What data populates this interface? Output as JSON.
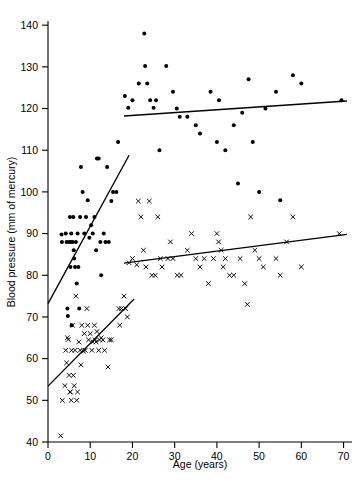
{
  "chart_data": {
    "type": "scatter",
    "title": "",
    "xlabel": "Age (years)",
    "ylabel": "Blood pressure (mm of mercury)",
    "xlim": [
      0,
      72
    ],
    "ylim": [
      40,
      141
    ],
    "xticks": [
      0,
      10,
      20,
      30,
      40,
      50,
      60,
      70
    ],
    "yticks": [
      40,
      50,
      60,
      70,
      80,
      90,
      100,
      110,
      120,
      130,
      140
    ],
    "xtick_labels": [
      "0",
      "10",
      "20",
      "30",
      "40",
      "50",
      "60",
      "70"
    ],
    "ytick_labels": [
      "40",
      "50",
      "60",
      "70",
      "80",
      "90",
      "100",
      "110",
      "120",
      "130",
      "140"
    ],
    "grid": false,
    "legend": "none",
    "series": [
      {
        "name": "Systolic blood pressure",
        "marker": "filled-circle",
        "color": "#000000",
        "points": [
          [
            3.2,
            89.8
          ],
          [
            3.3,
            88.0
          ],
          [
            4.2,
            90.0
          ],
          [
            4.4,
            88.0
          ],
          [
            4.6,
            72.0
          ],
          [
            4.7,
            70.2
          ],
          [
            5.0,
            88.0
          ],
          [
            5.2,
            94.0
          ],
          [
            5.3,
            82.0
          ],
          [
            5.4,
            88.0
          ],
          [
            5.5,
            90.0
          ],
          [
            5.6,
            68.0
          ],
          [
            5.8,
            88.0
          ],
          [
            6.0,
            94.0
          ],
          [
            6.1,
            86.0
          ],
          [
            6.2,
            84.0
          ],
          [
            6.4,
            82.0
          ],
          [
            6.6,
            88.0
          ],
          [
            6.8,
            78.0
          ],
          [
            7.0,
            90.0
          ],
          [
            7.2,
            82.0
          ],
          [
            7.4,
            72.0
          ],
          [
            7.6,
            94.0
          ],
          [
            7.8,
            106.0
          ],
          [
            8.2,
            100.0
          ],
          [
            8.6,
            90.0
          ],
          [
            9.0,
            94.0
          ],
          [
            9.4,
            98.0
          ],
          [
            9.8,
            89.0
          ],
          [
            10.2,
            92.0
          ],
          [
            10.6,
            90.0
          ],
          [
            11.0,
            94.0
          ],
          [
            11.4,
            86.0
          ],
          [
            11.6,
            108.0
          ],
          [
            12.0,
            108.0
          ],
          [
            12.4,
            88.0
          ],
          [
            12.6,
            80.0
          ],
          [
            13.2,
            90.0
          ],
          [
            13.6,
            88.0
          ],
          [
            14.0,
            106.0
          ],
          [
            14.4,
            88.0
          ],
          [
            15.0,
            97.8
          ],
          [
            15.4,
            100.0
          ],
          [
            16.2,
            100.0
          ],
          [
            16.6,
            112.0
          ],
          [
            18.2,
            123.0
          ],
          [
            19.0,
            120.2
          ],
          [
            20.0,
            122.0
          ],
          [
            21.5,
            126.0
          ],
          [
            22.8,
            138.0
          ],
          [
            23.0,
            130.2
          ],
          [
            23.5,
            126.0
          ],
          [
            24.2,
            122.0
          ],
          [
            25.0,
            120.2
          ],
          [
            25.6,
            122.0
          ],
          [
            26.4,
            110.0
          ],
          [
            28.0,
            130.2
          ],
          [
            29.6,
            124.0
          ],
          [
            30.5,
            120.0
          ],
          [
            31.2,
            118.0
          ],
          [
            33.0,
            118.0
          ],
          [
            35.0,
            116.0
          ],
          [
            36.0,
            114.0
          ],
          [
            38.5,
            124.0
          ],
          [
            40.0,
            112.0
          ],
          [
            40.5,
            122.0
          ],
          [
            42.0,
            110.0
          ],
          [
            44.0,
            116.0
          ],
          [
            45.0,
            102.0
          ],
          [
            46.0,
            119.0
          ],
          [
            47.5,
            127.0
          ],
          [
            48.5,
            112.0
          ],
          [
            50.0,
            100.0
          ],
          [
            51.5,
            120.0
          ],
          [
            54.0,
            124.0
          ],
          [
            55.0,
            98.0
          ],
          [
            58.0,
            128.0
          ],
          [
            60.0,
            126.0
          ],
          [
            69.5,
            122.0
          ]
        ]
      },
      {
        "name": "Diastolic blood pressure",
        "marker": "cross",
        "color": "#000000",
        "points": [
          [
            3.0,
            41.5
          ],
          [
            3.4,
            50.0
          ],
          [
            4.0,
            53.5
          ],
          [
            4.2,
            62.0
          ],
          [
            4.4,
            59.0
          ],
          [
            4.6,
            65.0
          ],
          [
            4.8,
            64.6
          ],
          [
            5.0,
            56.0
          ],
          [
            5.2,
            52.0
          ],
          [
            5.3,
            52.0
          ],
          [
            5.5,
            50.0
          ],
          [
            5.6,
            62.0
          ],
          [
            5.8,
            68.0
          ],
          [
            6.0,
            56.0
          ],
          [
            6.2,
            53.5
          ],
          [
            6.4,
            62.0
          ],
          [
            6.6,
            75.0
          ],
          [
            6.8,
            50.0
          ],
          [
            7.0,
            52.0
          ],
          [
            7.3,
            64.0
          ],
          [
            7.6,
            62.0
          ],
          [
            7.8,
            58.5
          ],
          [
            8.0,
            68.0
          ],
          [
            8.4,
            61.8
          ],
          [
            8.6,
            66.0
          ],
          [
            8.8,
            62.0
          ],
          [
            9.2,
            72.0
          ],
          [
            9.4,
            68.0
          ],
          [
            9.6,
            64.5
          ],
          [
            10.0,
            66.0
          ],
          [
            10.4,
            62.0
          ],
          [
            10.6,
            64.0
          ],
          [
            11.0,
            68.0
          ],
          [
            11.2,
            64.5
          ],
          [
            11.4,
            64.0
          ],
          [
            11.6,
            66.5
          ],
          [
            12.0,
            62.0
          ],
          [
            12.2,
            64.5
          ],
          [
            12.6,
            65.0
          ],
          [
            13.0,
            64.5
          ],
          [
            13.4,
            62.0
          ],
          [
            14.2,
            58.0
          ],
          [
            14.6,
            64.5
          ],
          [
            15.0,
            64.5
          ],
          [
            16.8,
            72.0
          ],
          [
            17.0,
            68.0
          ],
          [
            17.4,
            72.0
          ],
          [
            18.0,
            75.0
          ],
          [
            18.4,
            72.0
          ],
          [
            18.8,
            70.0
          ],
          [
            19.2,
            83.0
          ],
          [
            20.0,
            84.0
          ],
          [
            21.0,
            82.5
          ],
          [
            21.4,
            97.8
          ],
          [
            22.0,
            94.0
          ],
          [
            22.6,
            86.0
          ],
          [
            23.2,
            82.0
          ],
          [
            24.0,
            97.8
          ],
          [
            24.6,
            80.0
          ],
          [
            25.4,
            80.0
          ],
          [
            26.0,
            94.0
          ],
          [
            26.6,
            84.0
          ],
          [
            27.0,
            82.0
          ],
          [
            28.4,
            84.0
          ],
          [
            29.0,
            88.0
          ],
          [
            29.6,
            84.0
          ],
          [
            30.6,
            80.0
          ],
          [
            31.5,
            80.0
          ],
          [
            33.0,
            86.0
          ],
          [
            34.0,
            90.0
          ],
          [
            35.0,
            84.0
          ],
          [
            36.0,
            82.0
          ],
          [
            37.0,
            84.0
          ],
          [
            38.0,
            78.0
          ],
          [
            39.2,
            84.0
          ],
          [
            40.0,
            90.0
          ],
          [
            40.4,
            88.0
          ],
          [
            41.0,
            86.0
          ],
          [
            41.5,
            82.0
          ],
          [
            42.0,
            84.0
          ],
          [
            43.0,
            80.0
          ],
          [
            44.0,
            80.0
          ],
          [
            45.5,
            84.0
          ],
          [
            46.6,
            78.0
          ],
          [
            47.2,
            73.0
          ],
          [
            48.0,
            94.0
          ],
          [
            49.0,
            86.0
          ],
          [
            50.0,
            84.0
          ],
          [
            51.0,
            82.0
          ],
          [
            54.0,
            84.0
          ],
          [
            55.0,
            80.0
          ],
          [
            56.5,
            88.0
          ],
          [
            58.0,
            94.0
          ],
          [
            60.0,
            82.0
          ],
          [
            69.0,
            90.0
          ]
        ]
      }
    ],
    "trend_lines": [
      {
        "name": "child-systolic-trend",
        "x0": 0.0,
        "y0": 73.2,
        "x1": 19.2,
        "y1": 108.8
      },
      {
        "name": "child-diastolic-trend",
        "x0": 0.0,
        "y0": 53.4,
        "x1": 20.4,
        "y1": 74.3
      },
      {
        "name": "adult-systolic-trend",
        "x0": 18.0,
        "y0": 118.2,
        "x1": 70.8,
        "y1": 121.8
      },
      {
        "name": "adult-diastolic-trend",
        "x0": 18.0,
        "y0": 82.9,
        "x1": 70.8,
        "y1": 89.8
      }
    ]
  }
}
